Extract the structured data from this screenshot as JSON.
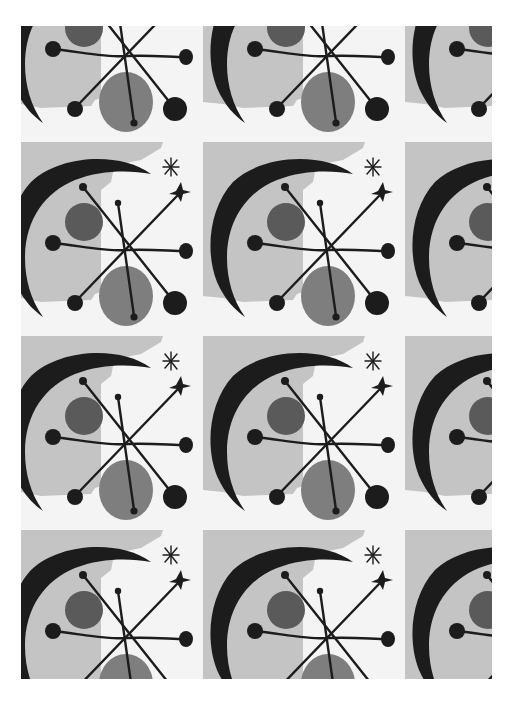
{
  "image": {
    "subject": "Mid-century atomic-style repeating textile pattern",
    "palette": {
      "background": "#f4f4f4",
      "light_gray": "#c4c4c4",
      "mid_gray": "#7e7e7e",
      "dark_gray": "#5a5a5a",
      "black": "#1c1c1c"
    },
    "tile": {
      "width": 202,
      "height": 194
    },
    "grid": {
      "columns": 3,
      "rows": 4
    },
    "motifs": [
      "crescent-moon",
      "starburst",
      "dark-circle",
      "light-circle",
      "four-point-star",
      "asterisk",
      "gray-square"
    ]
  }
}
